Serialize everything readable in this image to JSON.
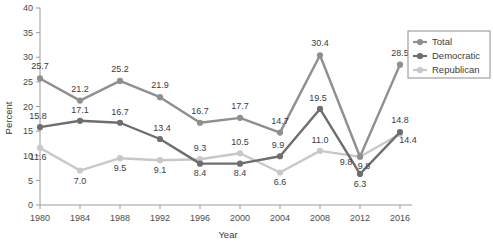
{
  "chart_data": {
    "type": "line",
    "title": "",
    "xlabel": "Year",
    "ylabel": "Percent",
    "categories": [
      1980,
      1984,
      1988,
      1992,
      1996,
      2000,
      2004,
      2008,
      2012,
      2016
    ],
    "x": [
      "1980",
      "1984",
      "1988",
      "1992",
      "1996",
      "2000",
      "2004",
      "2008",
      "2012",
      "2016"
    ],
    "ylim": [
      0,
      40
    ],
    "yticks": [
      "0",
      "5",
      "10",
      "15",
      "20",
      "25",
      "30",
      "35",
      "40"
    ],
    "ytick_step": 5,
    "grid": false,
    "legend_position": "right-outside",
    "data_labels": true,
    "series": [
      {
        "name": "Total",
        "color": "#8f8f8f",
        "values": [
          25.7,
          21.2,
          25.2,
          21.9,
          16.7,
          17.7,
          14.7,
          30.4,
          9.8,
          28.5
        ],
        "labels": [
          "25.7",
          "21.2",
          "25.2",
          "21.9",
          "16.7",
          "17.7",
          "14.7",
          "30.4",
          "9.8",
          "28.5"
        ]
      },
      {
        "name": "Democratic",
        "color": "#6e6e6e",
        "values": [
          15.8,
          17.1,
          16.7,
          13.4,
          8.4,
          8.4,
          9.9,
          19.5,
          6.3,
          14.8
        ],
        "labels": [
          "15.8",
          "17.1",
          "16.7",
          "13.4",
          "8.4",
          "8.4",
          "9.9",
          "19.5",
          "6.3",
          "14.8"
        ]
      },
      {
        "name": "Republican",
        "color": "#c8c8c8",
        "values": [
          11.6,
          7.0,
          9.5,
          9.1,
          9.3,
          10.5,
          6.6,
          11.0,
          9.8,
          14.4
        ],
        "labels": [
          "11.6",
          "7.0",
          "9.5",
          "9.1",
          "9.3",
          "10.5",
          "6.6",
          "11.0",
          "9.8",
          "14.4"
        ]
      }
    ],
    "legend": [
      {
        "label": "Total",
        "color": "#8f8f8f"
      },
      {
        "label": "Democratic",
        "color": "#6e6e6e"
      },
      {
        "label": "Republican",
        "color": "#c8c8c8"
      }
    ]
  }
}
